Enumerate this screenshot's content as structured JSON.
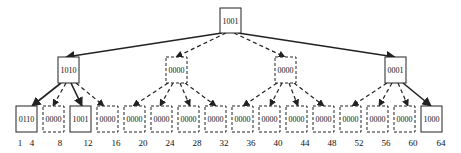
{
  "diagram": {
    "type": "tree",
    "root": {
      "label": "1001",
      "style": "solid"
    },
    "level2": [
      {
        "label": "1010",
        "style": "solid"
      },
      {
        "label": "0000",
        "style": "dashed"
      },
      {
        "label": "0000",
        "style": "dashed"
      },
      {
        "label": "0001",
        "style": "solid"
      }
    ],
    "leaves": [
      {
        "label": "0110",
        "style": "solid"
      },
      {
        "label": "0000",
        "style": "dashed"
      },
      {
        "label": "1001",
        "style": "solid"
      },
      {
        "label": "0000",
        "style": "dashed"
      },
      {
        "label": "0000",
        "style": "dashed"
      },
      {
        "label": "0000",
        "style": "dashed"
      },
      {
        "label": "0000",
        "style": "dashed"
      },
      {
        "label": "0000",
        "style": "dashed"
      },
      {
        "label": "0000",
        "style": "dashed"
      },
      {
        "label": "0000",
        "style": "dashed"
      },
      {
        "label": "0000",
        "style": "dashed"
      },
      {
        "label": "0000",
        "style": "dashed"
      },
      {
        "label": "0000",
        "style": "dashed"
      },
      {
        "label": "0000",
        "style": "dashed"
      },
      {
        "label": "0000",
        "style": "dashed"
      },
      {
        "label": "1000",
        "style": "solid"
      }
    ],
    "axis_labels": [
      "1",
      "4",
      "8",
      "12",
      "16",
      "20",
      "24",
      "28",
      "32",
      "36",
      "40",
      "44",
      "48",
      "52",
      "56",
      "60",
      "64"
    ],
    "colors": {
      "stroke": "#222222",
      "text": "#111111",
      "background": "#ffffff"
    }
  }
}
